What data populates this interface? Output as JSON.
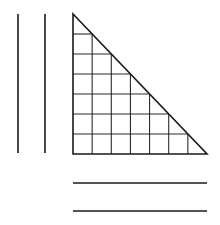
{
  "diagram": {
    "stroke_color": "#1a1a1a",
    "grid_color": "#2a2a2a",
    "background": "#ffffff",
    "vertical_lines": [
      {
        "x": 18,
        "y1": 14,
        "y2": 153
      },
      {
        "x": 45,
        "y1": 14,
        "y2": 153
      }
    ],
    "horizontal_lines": [
      {
        "y": 183,
        "x1": 73,
        "x2": 207
      },
      {
        "y": 211,
        "x1": 73,
        "x2": 207
      }
    ],
    "triangle": {
      "apex": [
        73,
        14
      ],
      "right_angle": [
        73,
        154
      ],
      "far_corner": [
        207,
        154
      ],
      "rows": 7,
      "cols": 7
    }
  }
}
